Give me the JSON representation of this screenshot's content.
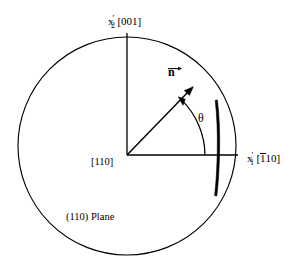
{
  "figure": {
    "caption": "(110) Plane",
    "background_color": "#ffffff",
    "stroke_color": "#000000"
  },
  "labels": {
    "vertical_axis": {
      "symbol": "x",
      "prime": "′",
      "subscript": "2",
      "direction_index": "[001]",
      "full_text": "x′2[001]"
    },
    "horizontal_axis": {
      "symbol": "x",
      "prime": "′",
      "subscript": "1",
      "direction_index_open": "[",
      "direction_index_barred_digit": "1",
      "direction_index_rest": "10",
      "direction_index_close": "]",
      "full_text": "x′1[̅1 1 0]"
    },
    "origin_direction": "[110]",
    "plane_caption": "(110) Plane",
    "normal_vector": "n",
    "angle_symbol": "θ"
  },
  "geometry": {
    "circle": {
      "center_x": 127,
      "center_y": 146,
      "radius": 109
    },
    "origin": {
      "x": 127,
      "y": 155
    },
    "vertical_axis": {
      "x": 127,
      "y_top": 33,
      "y_bottom": 155
    },
    "horizontal_axis": {
      "y": 155,
      "x_left": 127,
      "x_right": 238
    },
    "normal_arrow": {
      "from_x": 127,
      "from_y": 155,
      "to_x": 193,
      "to_y": 87
    },
    "angle_arc": {
      "radius": 78,
      "start_deg": 0,
      "end_deg": 46
    },
    "edge_bar": {
      "x": 218,
      "y_top": 100,
      "y_bottom": 196,
      "width": 4
    }
  }
}
